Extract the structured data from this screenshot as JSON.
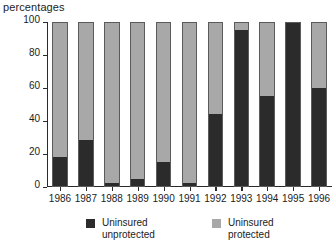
{
  "chart_data": {
    "type": "bar",
    "subtype": "stacked-bar-100",
    "title": "percentages",
    "xlabel": "",
    "ylabel": "",
    "ylim": [
      0,
      100
    ],
    "yticks": [
      0,
      20,
      40,
      60,
      80,
      100
    ],
    "grid": false,
    "legend_position": "bottom",
    "categories": [
      "1986",
      "1987",
      "1988",
      "1989",
      "1990",
      "1991",
      "1992",
      "1993",
      "1994",
      "1995",
      "1996"
    ],
    "series": [
      {
        "name": "Uninsured\nunprotected",
        "name_line1": "Uninsured",
        "name_line2": "unprotected",
        "color": "#2b2b2b",
        "values": [
          18,
          28,
          2,
          4,
          15,
          2,
          44,
          96,
          55,
          100,
          60
        ]
      },
      {
        "name": "Uninsured\nprotected",
        "name_line1": "Uninsured",
        "name_line2": "protected",
        "color": "#a8a8a8",
        "values": [
          82,
          72,
          98,
          96,
          85,
          98,
          56,
          4,
          45,
          0,
          40
        ]
      }
    ]
  }
}
